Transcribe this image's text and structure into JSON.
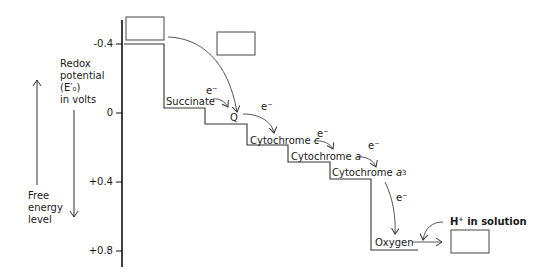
{
  "axis": {
    "title_lines": [
      "Redox",
      "potential",
      "(E′₀)",
      "in volts"
    ],
    "ticks": [
      {
        "label": "-0.4",
        "value": -0.4
      },
      {
        "label": "0",
        "value": 0
      },
      {
        "label": "+0.4",
        "value": 0.4
      },
      {
        "label": "+0.8",
        "value": 0.8
      }
    ]
  },
  "free_energy": {
    "lines": [
      "Free",
      "energy",
      "level"
    ]
  },
  "steps": [
    {
      "label": "Succinate"
    },
    {
      "label": "Q"
    },
    {
      "label": "Cytochrome",
      "italic": "c"
    },
    {
      "label": "Cytochrome",
      "italic": "a"
    },
    {
      "label": "Cytochrome",
      "italic": "a",
      "subscript": "3"
    },
    {
      "label": "Oxygen"
    }
  ],
  "electron_label": "e⁻",
  "proton": {
    "label": "H⁺ in solution"
  },
  "blank_boxes": [
    "top-left-box",
    "top-right-box",
    "product-box"
  ]
}
